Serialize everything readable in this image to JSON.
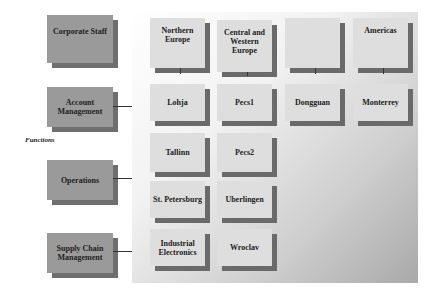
{
  "functions_label": "Functions",
  "functions": [
    {
      "label": "Corporate Staff"
    },
    {
      "label": "Account Management"
    },
    {
      "label": "Operations"
    },
    {
      "label": "Supply Chain Management"
    }
  ],
  "regions": [
    {
      "label": "Northern Europe"
    },
    {
      "label": "Central and Western Europe"
    },
    {
      "label": ""
    },
    {
      "label": "Americas"
    }
  ],
  "sites": {
    "row1": [
      "Lohja",
      "Pecs1",
      "Dongguan",
      "Monterrey"
    ],
    "row2": [
      "Tallinn",
      "Pecs2"
    ],
    "row3": [
      "St. Petersburg",
      "Uberlingen"
    ],
    "row4": [
      "Industrial Electronics",
      "Wroclav"
    ]
  },
  "colors": {
    "function_box": "#9a9a9a",
    "function_shadow": "#6f6f6f",
    "site_box": "#dedede",
    "site_shadow": "#6a6a6a"
  }
}
